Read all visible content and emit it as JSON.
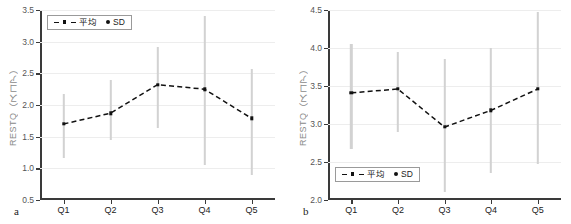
{
  "figure": {
    "panels": [
      {
        "letter": "a",
        "ylabel": "RESTQ（スコア）",
        "legend": {
          "mean_label": "平均",
          "sd_label": "SD"
        },
        "chart_data": {
          "type": "line",
          "title": "",
          "xlabel": "",
          "ylabel": "RESTQ（スコア）",
          "categories": [
            "Q1",
            "Q2",
            "Q3",
            "Q4",
            "Q5"
          ],
          "yticks": [
            "0.5",
            "1.0",
            "1.5",
            "2.0",
            "2.5",
            "3.0",
            "3.5"
          ],
          "ylim": [
            0.5,
            3.5
          ],
          "grid": true,
          "legend_position": "top-left",
          "series": [
            {
              "name": "平均",
              "values": [
                1.7,
                1.87,
                2.32,
                2.25,
                1.79
              ],
              "style": "dashed",
              "color": "#111111",
              "marker": "square"
            }
          ],
          "errorbars": {
            "name": "SD",
            "color": "#d2d2d2",
            "lower": [
              1.16,
              1.44,
              1.64,
              1.06,
              0.9
            ],
            "upper": [
              2.18,
              2.4,
              2.92,
              3.41,
              2.57
            ]
          }
        }
      },
      {
        "letter": "b",
        "ylabel": "RESTQ（スコア）",
        "legend": {
          "mean_label": "平均",
          "sd_label": "SD"
        },
        "chart_data": {
          "type": "line",
          "title": "",
          "xlabel": "",
          "ylabel": "RESTQ（スコア）",
          "categories": [
            "Q1",
            "Q2",
            "Q3",
            "Q4",
            "Q5"
          ],
          "yticks": [
            "2.0",
            "2.5",
            "3.0",
            "3.5",
            "4.0",
            "4.5"
          ],
          "ylim": [
            2.0,
            4.5
          ],
          "grid": true,
          "legend_position": "bottom-left",
          "series": [
            {
              "name": "平均",
              "values": [
                3.41,
                3.46,
                2.96,
                3.18,
                3.46
              ],
              "style": "dashed",
              "color": "#111111",
              "marker": "square"
            }
          ],
          "errorbars": {
            "name": "SD",
            "color": "#d2d2d2",
            "lower": [
              2.67,
              2.89,
              2.1,
              2.36,
              2.47
            ],
            "upper": [
              4.05,
              3.95,
              3.85,
              4.0,
              4.48
            ]
          }
        }
      }
    ]
  }
}
